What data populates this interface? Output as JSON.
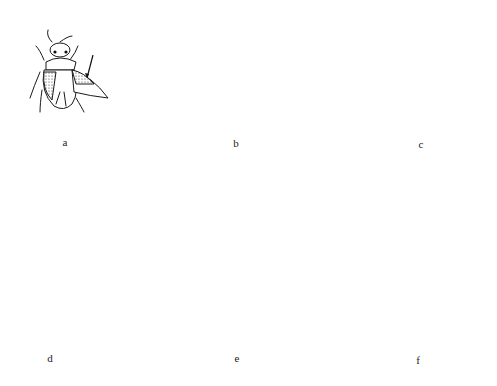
{
  "figure": {
    "panels": [
      {
        "id": "a",
        "label": "a",
        "description": "bug with hemelytra, one wing spread; arrow to thickened forewing base"
      },
      {
        "id": "b",
        "label": "b",
        "description": "beetle-like insect, one wing spread; arrow to stippled forewing"
      },
      {
        "id": "c",
        "label": "c",
        "description": "beetle with elytra meeting at midline; arrow to elytral suture"
      },
      {
        "id": "d",
        "label": "d",
        "description": "earwig with short tegmina and forceps; arrow to short forewings"
      },
      {
        "id": "e",
        "label": "e",
        "description": "nymph with long antennae and wing pads; arrow to wing pad"
      },
      {
        "id": "f",
        "label": "f",
        "description": "small bug nymph; arrow to dark wing pad"
      }
    ],
    "colors": {
      "line": "#1a1a1a",
      "background": "#ffffff",
      "stipple": "#9a9a9a"
    }
  }
}
